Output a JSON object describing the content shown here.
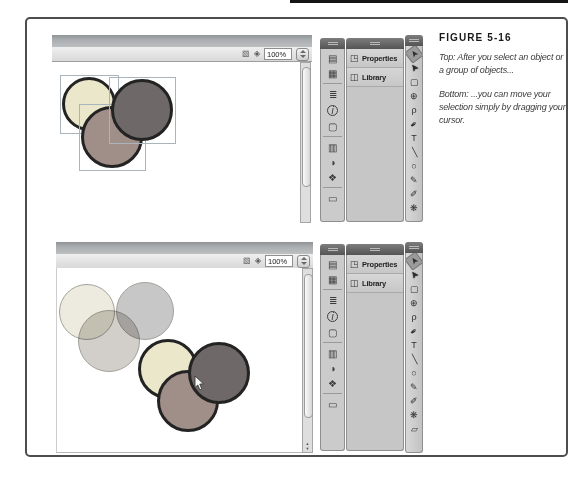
{
  "figure": {
    "title": "FIGURE 5-16",
    "captions": [
      "Top: After you select an object or a group of objects...",
      "Bottom: ...you can move your selection simply by dragging your cursor."
    ]
  },
  "toolbar": {
    "zoom_value": "100%",
    "edit_scene_glyph": "▧",
    "edit_symbols_glyph": "◈"
  },
  "panels": {
    "properties_label": "Properties",
    "library_label": "Library",
    "properties_icon": "◳",
    "library_icon": "◫"
  },
  "dock_icons": [
    {
      "name": "history-panel",
      "glyph": "▤"
    },
    {
      "name": "motion-presets-panel",
      "glyph": "▦"
    },
    {
      "sep": true
    },
    {
      "name": "align-panel",
      "glyph": "≣"
    },
    {
      "name": "info-panel",
      "glyph": "i"
    },
    {
      "name": "transform-panel",
      "glyph": "▢"
    },
    {
      "sep": true
    },
    {
      "name": "code-snippets-panel",
      "glyph": "▥"
    },
    {
      "name": "color-panel",
      "glyph": "◑"
    },
    {
      "name": "swatches-panel",
      "glyph": "❖"
    },
    {
      "sep": true
    },
    {
      "name": "library-dock-panel",
      "glyph": "▭"
    }
  ],
  "tools": [
    {
      "name": "selection-tool",
      "glyph": "➤",
      "selected": true
    },
    {
      "name": "subselection-tool",
      "glyph": "➤"
    },
    {
      "name": "free-transform-tool",
      "glyph": "▢"
    },
    {
      "name": "3d-rotation-tool",
      "glyph": "⊕"
    },
    {
      "name": "lasso-tool",
      "glyph": "ρ"
    },
    {
      "name": "pen-tool",
      "glyph": "✒"
    },
    {
      "name": "text-tool",
      "glyph": "T"
    },
    {
      "name": "line-tool",
      "glyph": "╲"
    },
    {
      "name": "oval-tool",
      "glyph": "○"
    },
    {
      "name": "pencil-tool",
      "glyph": "✎"
    },
    {
      "name": "brush-tool",
      "glyph": "✐"
    },
    {
      "name": "deco-tool",
      "glyph": "❋"
    },
    {
      "name": "eraser-tool",
      "glyph": "▱"
    }
  ],
  "colors": {
    "outline": "#232323",
    "light_fill": "#eae7cb",
    "medium_fill": "#a08f88",
    "dark_fill": "#6e6868",
    "light_ghost_fill": "#edebdf",
    "medium_ghost_fill": "#d2cfcb",
    "dark_ghost_fill": "#c7c7c7",
    "ghost_edge": "#a3a19b",
    "selection_box": "#a9b4bd"
  },
  "shot_a": {
    "circles": [
      {
        "name": "yellow-circle",
        "fill": "light",
        "cx": 37,
        "cy": 69,
        "r": 27,
        "kind": "solid",
        "selected": true
      },
      {
        "name": "orange-circle",
        "fill": "medium",
        "cx": 60,
        "cy": 102,
        "r": 31,
        "kind": "solid",
        "selected": true
      },
      {
        "name": "maroon-circle",
        "fill": "dark",
        "cx": 90,
        "cy": 75,
        "r": 31,
        "kind": "solid",
        "selected": true
      }
    ]
  },
  "shot_b": {
    "circles": [
      {
        "name": "yellow-circle-ghost",
        "fill": "light_ghost",
        "cx": 31,
        "cy": 70,
        "r": 28,
        "kind": "ghost"
      },
      {
        "name": "maroon-circle-ghost",
        "fill": "dark_ghost",
        "cx": 89,
        "cy": 69,
        "r": 29,
        "kind": "ghost"
      },
      {
        "name": "orange-circle-ghost",
        "fill": "medium_ghost",
        "cx": 53,
        "cy": 99,
        "r": 31,
        "kind": "ghost"
      },
      {
        "name": "yellow-circle",
        "fill": "light",
        "cx": 112,
        "cy": 127,
        "r": 30,
        "kind": "solid"
      },
      {
        "name": "orange-circle",
        "fill": "medium",
        "cx": 132,
        "cy": 159,
        "r": 31,
        "kind": "solid"
      },
      {
        "name": "maroon-circle",
        "fill": "dark",
        "cx": 163,
        "cy": 131,
        "r": 31,
        "kind": "solid"
      }
    ]
  }
}
